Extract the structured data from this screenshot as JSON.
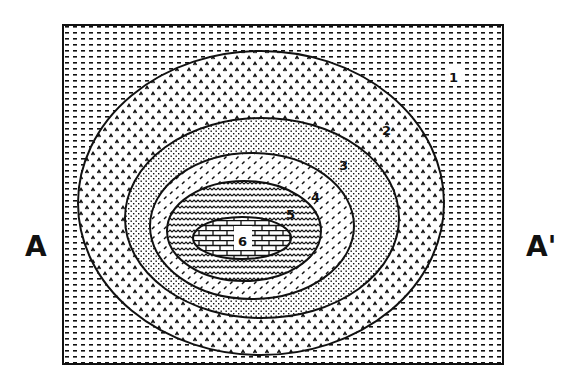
{
  "diagram": {
    "type": "geologic-map",
    "section_line": {
      "start_label": "A",
      "end_label": "A'"
    },
    "units": [
      {
        "id": "1",
        "label": "1",
        "pattern": "dashes",
        "position": "outermost"
      },
      {
        "id": "2",
        "label": "2",
        "pattern": "chevrons"
      },
      {
        "id": "3",
        "label": "3",
        "pattern": "stipple"
      },
      {
        "id": "4",
        "label": "4",
        "pattern": "slashes"
      },
      {
        "id": "5",
        "label": "5",
        "pattern": "wavy"
      },
      {
        "id": "6",
        "label": "6",
        "pattern": "brick",
        "position": "center"
      }
    ],
    "colors": {
      "ink": "#111111",
      "paper": "#ffffff"
    }
  }
}
